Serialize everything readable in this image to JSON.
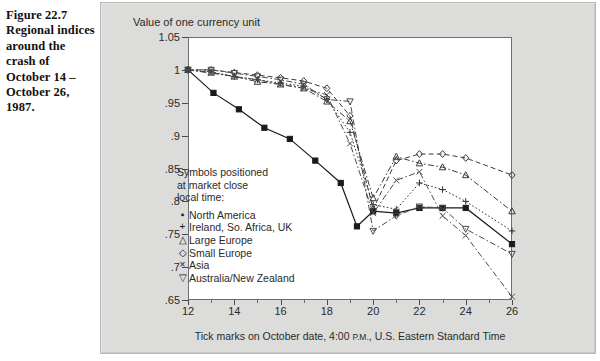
{
  "caption": {
    "figure_number": "Figure 22.7",
    "text": "Regional indices around the crash of October 14 –October 26, 1987."
  },
  "chart_data": {
    "type": "line",
    "title": "",
    "ylabel": "Value of one currency unit",
    "xlabel": "Tick marks on October date, 4:00 P.M., U.S. Eastern Standard Time",
    "xlabel_smallcaps": "P.M.",
    "ylim": [
      0.65,
      1.05
    ],
    "xlim": [
      12,
      26
    ],
    "yticks": [
      "1.05",
      "1",
      ".95",
      ".9",
      ".85",
      ".8",
      ".75",
      ".7",
      ".65"
    ],
    "ytick_values": [
      1.05,
      1.0,
      0.95,
      0.9,
      0.85,
      0.8,
      0.75,
      0.7,
      0.65
    ],
    "xticks": [
      "12",
      "14",
      "16",
      "18",
      "20",
      "22",
      "24",
      "26"
    ],
    "xtick_values": [
      12,
      14,
      16,
      18,
      20,
      22,
      24,
      26
    ],
    "grid": false,
    "legend_position": "inside-left",
    "legend_note": [
      "Symbols positioned",
      "at market close",
      "local time:"
    ],
    "series": [
      {
        "name": "North America",
        "symbol": "square-filled",
        "glyph": "▪",
        "line": "solid",
        "color": "#1a1a1a",
        "x": [
          12,
          13.1,
          14.2,
          15.3,
          16.4,
          17.5,
          18.6,
          19.3,
          20.0,
          21.0,
          22.0,
          23.0,
          24.0,
          26.0
        ],
        "values": [
          1.0,
          0.965,
          0.94,
          0.912,
          0.895,
          0.862,
          0.828,
          0.762,
          0.785,
          0.782,
          0.79,
          0.79,
          0.79,
          0.735
        ]
      },
      {
        "name": "Ireland, So. Africa, UK",
        "symbol": "plus",
        "glyph": "+",
        "line": "dotted",
        "color": "#333333",
        "x": [
          12,
          13.0,
          14.0,
          15.0,
          16.0,
          17.0,
          18.0,
          19.0,
          20.0,
          21.0,
          22.0,
          23.0,
          24.0,
          26.0
        ],
        "values": [
          1.0,
          0.997,
          0.99,
          0.985,
          0.98,
          0.975,
          0.955,
          0.905,
          0.795,
          0.788,
          0.828,
          0.818,
          0.8,
          0.755
        ]
      },
      {
        "name": "Large Europe",
        "symbol": "triangle",
        "glyph": "△",
        "line": "dash-dot",
        "color": "#3a3a3a",
        "x": [
          12,
          13.0,
          14.0,
          15.0,
          16.0,
          17.0,
          18.0,
          19.0,
          20.0,
          21.0,
          22.0,
          23.0,
          24.0,
          26.0
        ],
        "values": [
          1.0,
          0.996,
          0.99,
          0.982,
          0.978,
          0.972,
          0.952,
          0.922,
          0.805,
          0.868,
          0.858,
          0.852,
          0.84,
          0.785
        ]
      },
      {
        "name": "Small Europe",
        "symbol": "diamond",
        "glyph": "◇",
        "line": "dashed",
        "color": "#3a3a3a",
        "x": [
          12,
          13.0,
          14.0,
          15.0,
          16.0,
          17.0,
          18.0,
          19.0,
          20.0,
          21.0,
          22.0,
          23.0,
          24.0,
          26.0
        ],
        "values": [
          1.0,
          1.0,
          0.996,
          0.992,
          0.988,
          0.983,
          0.972,
          0.93,
          0.788,
          0.862,
          0.872,
          0.872,
          0.866,
          0.84
        ]
      },
      {
        "name": "Asia",
        "symbol": "cross",
        "glyph": "×",
        "line": "dash-dot",
        "color": "#4a4a4a",
        "x": [
          12,
          13.0,
          14.0,
          15.0,
          16.0,
          17.0,
          18.0,
          19.0,
          20.0,
          21.0,
          22.0,
          23.0,
          24.0,
          26.0
        ],
        "values": [
          1.0,
          0.995,
          0.99,
          0.985,
          0.978,
          0.972,
          0.962,
          0.888,
          0.782,
          0.832,
          0.845,
          0.778,
          0.748,
          0.655
        ]
      },
      {
        "name": "Australia/New Zealand",
        "symbol": "triangle-down",
        "glyph": "▽",
        "line": "dash-dot",
        "color": "#4a4a4a",
        "x": [
          12,
          13.0,
          14.0,
          15.0,
          16.0,
          17.0,
          18.0,
          19.0,
          20.0,
          21.0,
          22.0,
          23.0,
          24.0,
          26.0
        ],
        "values": [
          1.0,
          1.0,
          0.995,
          0.99,
          0.985,
          0.978,
          0.955,
          0.952,
          0.755,
          0.778,
          0.792,
          0.79,
          0.758,
          0.72
        ]
      }
    ]
  }
}
